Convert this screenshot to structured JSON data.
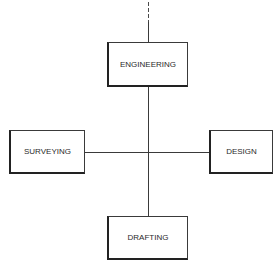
{
  "diagram": {
    "type": "organization-chart",
    "nodes": [
      {
        "id": "engineering",
        "label": "ENGINEERING",
        "position": "top"
      },
      {
        "id": "surveying",
        "label": "SURVEYING",
        "position": "left"
      },
      {
        "id": "design",
        "label": "DESIGN",
        "position": "right"
      },
      {
        "id": "drafting",
        "label": "DRAFTING",
        "position": "bottom"
      }
    ],
    "connectors": [
      {
        "from": "above",
        "to": "engineering",
        "style": "dashed-then-solid"
      },
      {
        "from": "engineering",
        "to": "drafting",
        "style": "solid"
      },
      {
        "from": "surveying",
        "to": "design",
        "style": "solid"
      }
    ],
    "colors": {
      "line": "#3a3a3a",
      "box_border": "#222222",
      "text": "#2a2a2a",
      "background": "#ffffff"
    }
  }
}
